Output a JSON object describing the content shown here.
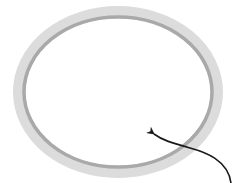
{
  "diagram": {
    "title": "",
    "elements": [
      {
        "kind": "ring",
        "name": "elliptical-ring",
        "description": "Elliptical ring with light gray outer band and darker gray inner edge"
      },
      {
        "kind": "arrow",
        "name": "pointer-arrow",
        "description": "Curved black arrow from bottom-right pointing into ring interior"
      }
    ],
    "colors": {
      "ring_outer": "#dcdcdc",
      "ring_inner_edge": "#a9a9a9",
      "arrow": "#1a1a1a",
      "background": "#ffffff"
    },
    "labels": []
  }
}
